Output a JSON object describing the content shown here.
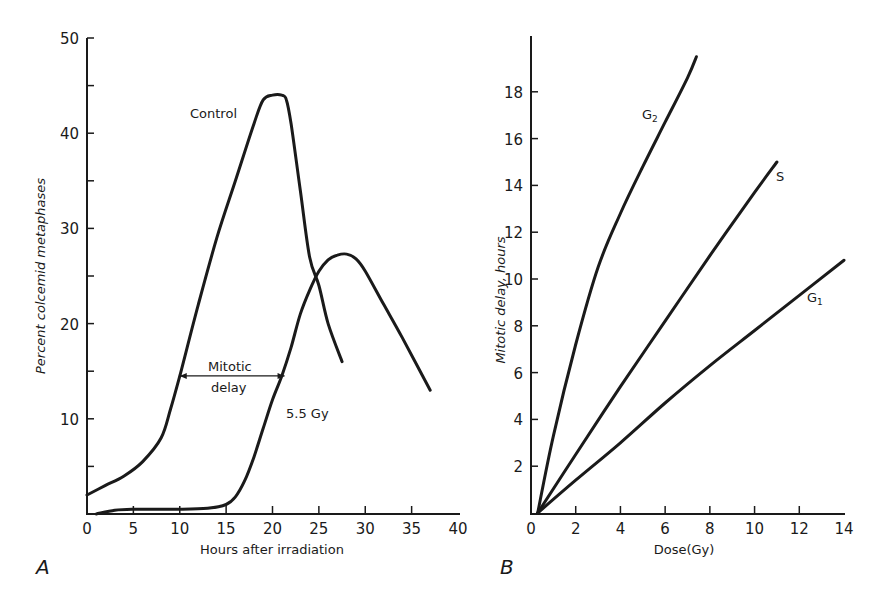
{
  "colors": {
    "ink": "#1a1a1a",
    "background": "#ffffff"
  },
  "chart_data": [
    {
      "panel": "A",
      "type": "line",
      "title": "",
      "xlabel": "Hours after irradiation",
      "ylabel": "Percent colcemid metaphases",
      "xlim": [
        0,
        40
      ],
      "ylim": [
        0,
        50
      ],
      "xticks": [
        0,
        5,
        10,
        15,
        20,
        25,
        30,
        35,
        40
      ],
      "yticks_labeled": [
        10,
        20,
        30,
        40,
        50
      ],
      "yticks_minor": [
        5,
        15,
        25,
        35,
        45
      ],
      "grid": false,
      "series": [
        {
          "name": "Control",
          "x": [
            0,
            2,
            4,
            6,
            8,
            9,
            10,
            12,
            14,
            16,
            18,
            19,
            20,
            21,
            21.5,
            22,
            23,
            24,
            25,
            26,
            27.5
          ],
          "y": [
            2,
            3,
            4,
            5.5,
            8,
            11,
            14.5,
            22,
            29,
            35,
            41,
            43.5,
            44,
            44,
            43.5,
            41,
            34,
            27,
            24,
            20,
            16
          ]
        },
        {
          "name": "5.5 Gy",
          "x": [
            1,
            3,
            5,
            10,
            13,
            15,
            16,
            17,
            18,
            19,
            20,
            21,
            22,
            23,
            24,
            25,
            26,
            27,
            28,
            29,
            30,
            32,
            34,
            37
          ],
          "y": [
            0,
            0.4,
            0.5,
            0.5,
            0.6,
            1,
            1.8,
            3.5,
            6,
            9,
            12,
            14.5,
            17.5,
            21,
            23.5,
            25.5,
            26.7,
            27.2,
            27.3,
            26.8,
            25.5,
            22,
            18.5,
            13
          ]
        }
      ],
      "annotations": [
        {
          "text": "Control",
          "x": 16.5,
          "y": 41.5
        },
        {
          "text": "Mitotic delay",
          "type": "double-arrow",
          "x_start": 10,
          "x_end": 21.3,
          "y": 14.5
        },
        {
          "text": "5.5 Gy",
          "x": 21.5,
          "y": 11
        }
      ]
    },
    {
      "panel": "B",
      "type": "line",
      "title": "",
      "xlabel": "Dose (Gy)",
      "ylabel": "Mitotic delay, hours",
      "xlim": [
        0,
        14
      ],
      "ylim": [
        0,
        20
      ],
      "xticks": [
        0,
        2,
        4,
        6,
        8,
        10,
        12,
        14
      ],
      "yticks": [
        2,
        4,
        6,
        8,
        10,
        12,
        14,
        16,
        18
      ],
      "grid": false,
      "series": [
        {
          "name": "G2",
          "x": [
            0.3,
            1,
            2,
            3,
            4,
            5,
            6,
            7,
            7.4
          ],
          "y": [
            0,
            3.3,
            7.2,
            10.5,
            12.8,
            14.8,
            16.7,
            18.6,
            19.5
          ]
        },
        {
          "name": "S",
          "x": [
            0.3,
            2,
            4,
            6,
            8,
            10,
            11
          ],
          "y": [
            0,
            2.5,
            5.4,
            8.2,
            11,
            13.7,
            15
          ]
        },
        {
          "name": "G1",
          "x": [
            0.3,
            2,
            4,
            6,
            8,
            10,
            12,
            14
          ],
          "y": [
            0,
            1.4,
            3,
            4.7,
            6.3,
            7.8,
            9.3,
            10.8
          ]
        }
      ],
      "annotations": [
        {
          "text": "G2",
          "x": 6.3,
          "y": 17.6
        },
        {
          "text": "S",
          "x": 11.3,
          "y": 14.5
        },
        {
          "text": "G1",
          "x": 12.6,
          "y": 10.1
        }
      ]
    }
  ],
  "panelA": {
    "panel_letter": "A",
    "xlabel": "Hours after irradiation",
    "ylabel": "Percent colcemid metaphases",
    "xtick_labels": [
      "0",
      "5",
      "10",
      "15",
      "20",
      "25",
      "30",
      "35",
      "40"
    ],
    "ytick_labels": [
      "10",
      "20",
      "30",
      "40",
      "50"
    ],
    "label_control": "Control",
    "label_mitotic": "Mitotic",
    "label_delay": "delay",
    "label_dose": "5.5 Gy"
  },
  "panelB": {
    "panel_letter": "B",
    "xlabel": "Dose(Gy)",
    "ylabel": "Mitotic delay, hours",
    "xtick_labels": [
      "0",
      "2",
      "4",
      "6",
      "8",
      "10",
      "12",
      "14"
    ],
    "ytick_labels": [
      "2",
      "4",
      "6",
      "8",
      "10",
      "12",
      "14",
      "16",
      "18"
    ],
    "label_g2": "G",
    "label_g2_sub": "2",
    "label_s": "S",
    "label_g1": "G",
    "label_g1_sub": "1"
  }
}
